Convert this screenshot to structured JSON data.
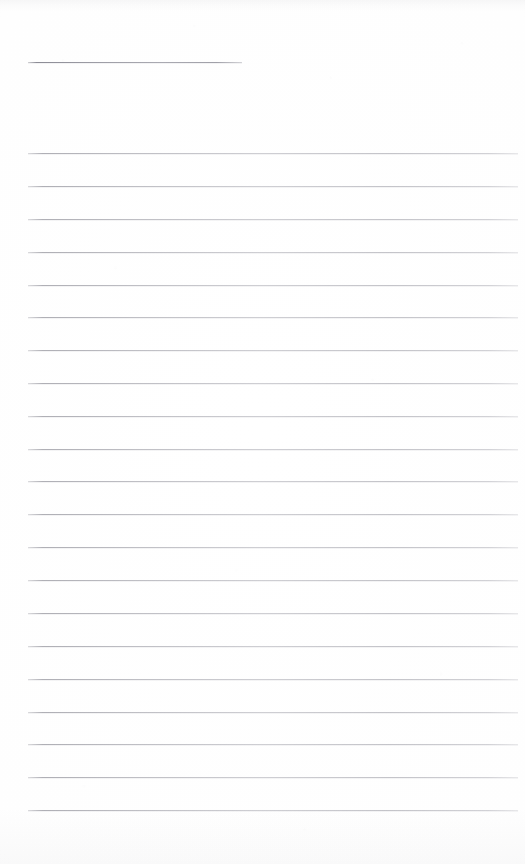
{
  "page": {
    "kind": "scanned-lined-notebook-page",
    "width": 525,
    "height": 864,
    "background_color": "#fefefe",
    "has_visible_text": false,
    "has_handwriting": false,
    "content_note": "",
    "rule_color": "#8a8a94",
    "rule_margin_left": 28,
    "rule_margin_right": 518
  },
  "rules": [
    {
      "name": "short-rule-1",
      "y": 62,
      "x_start": 28,
      "x_end": 242,
      "variant": "short"
    },
    {
      "name": "rule-1",
      "y": 153,
      "x_start": 28,
      "x_end": 518,
      "variant": "full"
    },
    {
      "name": "rule-2",
      "y": 186,
      "x_start": 28,
      "x_end": 518,
      "variant": "full"
    },
    {
      "name": "rule-3",
      "y": 219,
      "x_start": 28,
      "x_end": 518,
      "variant": "full"
    },
    {
      "name": "rule-4",
      "y": 252,
      "x_start": 28,
      "x_end": 518,
      "variant": "full"
    },
    {
      "name": "rule-5",
      "y": 285,
      "x_start": 28,
      "x_end": 518,
      "variant": "full"
    },
    {
      "name": "rule-6",
      "y": 317,
      "x_start": 28,
      "x_end": 518,
      "variant": "full"
    },
    {
      "name": "rule-7",
      "y": 350,
      "x_start": 28,
      "x_end": 518,
      "variant": "full"
    },
    {
      "name": "rule-8",
      "y": 383,
      "x_start": 28,
      "x_end": 518,
      "variant": "full"
    },
    {
      "name": "rule-9",
      "y": 416,
      "x_start": 28,
      "x_end": 518,
      "variant": "full"
    },
    {
      "name": "rule-10",
      "y": 449,
      "x_start": 28,
      "x_end": 518,
      "variant": "full"
    },
    {
      "name": "rule-11",
      "y": 481,
      "x_start": 28,
      "x_end": 518,
      "variant": "full"
    },
    {
      "name": "rule-12",
      "y": 514,
      "x_start": 28,
      "x_end": 518,
      "variant": "full"
    },
    {
      "name": "rule-13",
      "y": 547,
      "x_start": 28,
      "x_end": 518,
      "variant": "full"
    },
    {
      "name": "rule-14",
      "y": 580,
      "x_start": 28,
      "x_end": 518,
      "variant": "full"
    },
    {
      "name": "rule-15",
      "y": 613,
      "x_start": 28,
      "x_end": 518,
      "variant": "full"
    },
    {
      "name": "rule-16",
      "y": 646,
      "x_start": 28,
      "x_end": 518,
      "variant": "full"
    },
    {
      "name": "rule-17",
      "y": 679,
      "x_start": 28,
      "x_end": 518,
      "variant": "full"
    },
    {
      "name": "rule-18",
      "y": 712,
      "x_start": 28,
      "x_end": 518,
      "variant": "full"
    },
    {
      "name": "rule-19",
      "y": 744,
      "x_start": 28,
      "x_end": 518,
      "variant": "full"
    },
    {
      "name": "rule-20",
      "y": 777,
      "x_start": 28,
      "x_end": 518,
      "variant": "full"
    },
    {
      "name": "rule-21",
      "y": 810,
      "x_start": 28,
      "x_end": 518,
      "variant": "full"
    }
  ]
}
